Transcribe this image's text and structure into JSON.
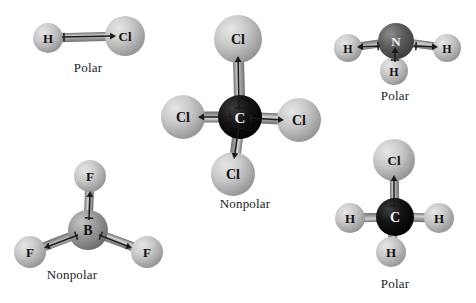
{
  "figure": {
    "background_color": "#ffffff",
    "width": 476,
    "height": 303
  },
  "palette": {
    "sphere_light": "#c8c8c8",
    "sphere_light_hi": "#e6e6e6",
    "sphere_light_lo": "#8f8f8f",
    "sphere_mid": "#9a9a9a",
    "sphere_mid_hi": "#c4c4c4",
    "sphere_mid_lo": "#6a6a6a",
    "sphere_dark": "#5e5e5e",
    "sphere_dark_hi": "#8c8c8c",
    "sphere_dark_lo": "#3a3a3a",
    "sphere_black": "#141414",
    "sphere_black_hi": "#3d3d3d",
    "sphere_black_lo": "#000000",
    "bond_color": "#a8a8a8",
    "bond_edge": "#6f6f6f",
    "arrow_color": "#1c1c1c",
    "label_dark": "#111111",
    "label_light": "#f2f2f2"
  },
  "molecules": [
    {
      "id": "hcl",
      "name": "hydrogen-chloride",
      "formula": "HCl",
      "polarity": "Polar",
      "label_position": {
        "x": 38,
        "y": 60,
        "width": 100
      },
      "origin": {
        "x": 20,
        "y": 8
      },
      "viewbox": {
        "width": 140,
        "height": 60
      },
      "atoms": [
        {
          "symbol": "H",
          "cx": 28,
          "cy": 30,
          "r": 15,
          "shade": "light",
          "label_color": "dark",
          "font_size": 13
        },
        {
          "symbol": "Cl",
          "cx": 105,
          "cy": 28,
          "r": 20,
          "shade": "light",
          "label_color": "dark",
          "font_size": 13
        }
      ],
      "bonds": [
        {
          "x1": 28,
          "y1": 30,
          "x2": 105,
          "y2": 28,
          "width": 9
        }
      ],
      "dipoles": [
        {
          "x1": 42,
          "y1": 29,
          "x2": 96,
          "y2": 28,
          "cross": true
        }
      ]
    },
    {
      "id": "ccl4",
      "name": "carbon-tetrachloride",
      "formula": "CCl4",
      "polarity": "Nonpolar",
      "label_position": {
        "x": 185,
        "y": 196,
        "width": 120
      },
      "origin": {
        "x": 160,
        "y": 12
      },
      "viewbox": {
        "width": 160,
        "height": 185
      },
      "atoms": [
        {
          "symbol": "Cl",
          "cx": 78,
          "cy": 27,
          "r": 24,
          "shade": "light",
          "label_color": "dark",
          "font_size": 14
        },
        {
          "symbol": "Cl",
          "cx": 23,
          "cy": 105,
          "r": 22,
          "shade": "light",
          "label_color": "dark",
          "font_size": 14
        },
        {
          "symbol": "Cl",
          "cx": 139,
          "cy": 108,
          "r": 22,
          "shade": "light",
          "label_color": "dark",
          "font_size": 14
        },
        {
          "symbol": "Cl",
          "cx": 73,
          "cy": 162,
          "r": 22,
          "shade": "light",
          "label_color": "dark",
          "font_size": 14
        },
        {
          "symbol": "C",
          "cx": 80,
          "cy": 105,
          "r": 22,
          "shade": "black",
          "label_color": "light",
          "font_size": 15
        }
      ],
      "bonds": [
        {
          "x1": 80,
          "y1": 105,
          "x2": 78,
          "y2": 27,
          "width": 11
        },
        {
          "x1": 80,
          "y1": 105,
          "x2": 23,
          "y2": 105,
          "width": 11
        },
        {
          "x1": 80,
          "y1": 105,
          "x2": 139,
          "y2": 108,
          "width": 11
        },
        {
          "x1": 80,
          "y1": 105,
          "x2": 73,
          "y2": 162,
          "width": 11
        }
      ],
      "dipoles": [
        {
          "x1": 79,
          "y1": 98,
          "x2": 78,
          "y2": 44,
          "cross": true
        },
        {
          "x1": 72,
          "y1": 105,
          "x2": 38,
          "y2": 105,
          "cross": true
        },
        {
          "x1": 89,
          "y1": 106,
          "x2": 124,
          "y2": 108,
          "cross": true
        },
        {
          "x1": 79,
          "y1": 114,
          "x2": 74,
          "y2": 147,
          "cross": true
        }
      ]
    },
    {
      "id": "nh3",
      "name": "ammonia",
      "formula": "NH3",
      "polarity": "Polar",
      "label_position": {
        "x": 340,
        "y": 88,
        "width": 110
      },
      "origin": {
        "x": 330,
        "y": 14
      },
      "viewbox": {
        "width": 140,
        "height": 78
      },
      "atoms": [
        {
          "symbol": "H",
          "cx": 18,
          "cy": 34,
          "r": 14,
          "shade": "light",
          "label_color": "dark",
          "font_size": 12
        },
        {
          "symbol": "H",
          "cx": 117,
          "cy": 34,
          "r": 14,
          "shade": "light",
          "label_color": "dark",
          "font_size": 12
        },
        {
          "symbol": "H",
          "cx": 64,
          "cy": 57,
          "r": 14,
          "shade": "light",
          "label_color": "dark",
          "font_size": 12
        },
        {
          "symbol": "N",
          "cx": 66,
          "cy": 27,
          "r": 18,
          "shade": "dark",
          "label_color": "light",
          "font_size": 13
        }
      ],
      "bonds": [
        {
          "x1": 66,
          "y1": 27,
          "x2": 18,
          "y2": 34,
          "width": 8
        },
        {
          "x1": 66,
          "y1": 27,
          "x2": 117,
          "y2": 34,
          "width": 8
        },
        {
          "x1": 66,
          "y1": 27,
          "x2": 64,
          "y2": 57,
          "width": 8
        }
      ],
      "dipoles": [
        {
          "x1": 50,
          "y1": 32,
          "x2": 27,
          "y2": 33,
          "cross": true,
          "reverse": true
        },
        {
          "x1": 84,
          "y1": 32,
          "x2": 108,
          "y2": 33,
          "cross": true,
          "reverse": true
        },
        {
          "x1": 65,
          "y1": 48,
          "x2": 65,
          "y2": 33,
          "cross": true
        }
      ]
    },
    {
      "id": "bf3",
      "name": "boron-trifluoride",
      "formula": "BF3",
      "polarity": "Nonpolar",
      "label_position": {
        "x": 12,
        "y": 267,
        "width": 120
      },
      "origin": {
        "x": 12,
        "y": 158
      },
      "viewbox": {
        "width": 160,
        "height": 110
      },
      "atoms": [
        {
          "symbol": "F",
          "cx": 78,
          "cy": 18,
          "r": 16,
          "shade": "light",
          "label_color": "dark",
          "font_size": 13
        },
        {
          "symbol": "F",
          "cx": 18,
          "cy": 94,
          "r": 16,
          "shade": "light",
          "label_color": "dark",
          "font_size": 13
        },
        {
          "symbol": "F",
          "cx": 135,
          "cy": 94,
          "r": 16,
          "shade": "light",
          "label_color": "dark",
          "font_size": 13
        },
        {
          "symbol": "B",
          "cx": 76,
          "cy": 72,
          "r": 20,
          "shade": "mid",
          "label_color": "dark",
          "font_size": 14
        }
      ],
      "bonds": [
        {
          "x1": 76,
          "y1": 72,
          "x2": 78,
          "y2": 18,
          "width": 9
        },
        {
          "x1": 76,
          "y1": 72,
          "x2": 18,
          "y2": 94,
          "width": 9
        },
        {
          "x1": 76,
          "y1": 72,
          "x2": 135,
          "y2": 94,
          "width": 9
        }
      ],
      "dipoles": [
        {
          "x1": 77,
          "y1": 62,
          "x2": 78,
          "y2": 33,
          "cross": true
        },
        {
          "x1": 66,
          "y1": 77,
          "x2": 32,
          "y2": 90,
          "cross": true
        },
        {
          "x1": 87,
          "y1": 77,
          "x2": 120,
          "y2": 90,
          "cross": true
        }
      ]
    },
    {
      "id": "ch3cl",
      "name": "chloromethane",
      "formula": "CH3Cl",
      "polarity": "Polar",
      "label_position": {
        "x": 340,
        "y": 276,
        "width": 110
      },
      "origin": {
        "x": 330,
        "y": 140
      },
      "viewbox": {
        "width": 140,
        "height": 135
      },
      "atoms": [
        {
          "symbol": "Cl",
          "cx": 64,
          "cy": 20,
          "r": 21,
          "shade": "light",
          "label_color": "dark",
          "font_size": 13
        },
        {
          "symbol": "H",
          "cx": 20,
          "cy": 78,
          "r": 15,
          "shade": "light",
          "label_color": "dark",
          "font_size": 13
        },
        {
          "symbol": "H",
          "cx": 109,
          "cy": 78,
          "r": 15,
          "shade": "light",
          "label_color": "dark",
          "font_size": 13
        },
        {
          "symbol": "H",
          "cx": 61,
          "cy": 112,
          "r": 15,
          "shade": "light",
          "label_color": "dark",
          "font_size": 13
        },
        {
          "symbol": "C",
          "cx": 65,
          "cy": 77,
          "r": 19,
          "shade": "black",
          "label_color": "light",
          "font_size": 14
        }
      ],
      "bonds": [
        {
          "x1": 65,
          "y1": 77,
          "x2": 64,
          "y2": 20,
          "width": 9
        },
        {
          "x1": 65,
          "y1": 77,
          "x2": 20,
          "y2": 78,
          "width": 9
        },
        {
          "x1": 65,
          "y1": 77,
          "x2": 109,
          "y2": 78,
          "width": 9
        },
        {
          "x1": 65,
          "y1": 77,
          "x2": 61,
          "y2": 112,
          "width": 9
        }
      ],
      "dipoles": [
        {
          "x1": 64,
          "y1": 68,
          "x2": 64,
          "y2": 35,
          "cross": true
        }
      ]
    }
  ]
}
